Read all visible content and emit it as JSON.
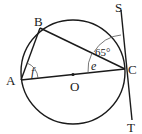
{
  "diagram": {
    "type": "circle-geometry",
    "points": {
      "A": {
        "label": "A",
        "x": 21,
        "y": 80
      },
      "B": {
        "label": "B",
        "x": 40,
        "y": 28
      },
      "C": {
        "label": "C",
        "x": 125,
        "y": 69
      },
      "O": {
        "label": "O",
        "x": 73,
        "y": 72
      },
      "S": {
        "label": "S",
        "x": 121,
        "y": 10
      },
      "T": {
        "label": "T",
        "x": 132,
        "y": 120
      }
    },
    "circle": {
      "center": "O",
      "radius": 52
    },
    "segments": [
      "AB",
      "BC",
      "AC",
      "ST"
    ],
    "tangent": {
      "line": "ST",
      "touches_at": "C"
    },
    "angles": {
      "angle_SCB": {
        "label": "65°"
      },
      "angle_BCA": {
        "label": "e"
      },
      "angle_BAC": {
        "label": "f"
      }
    }
  }
}
